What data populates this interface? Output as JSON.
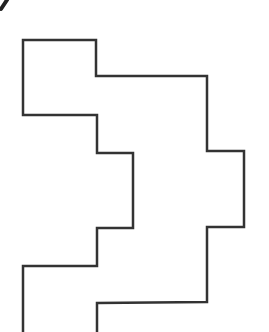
{
  "figure": {
    "width": 269,
    "height": 332,
    "background": "#ffffff",
    "stroke_color": "#333333",
    "stroke_width": 2.5,
    "corner_mark": {
      "points": [
        [
          7,
          0
        ],
        [
          1,
          9
        ]
      ],
      "color": "#222222",
      "width": 4
    },
    "outer_path": [
      [
        23,
        332
      ],
      [
        23,
        266
      ],
      [
        97,
        266
      ],
      [
        97,
        228
      ],
      [
        133,
        228
      ],
      [
        133,
        153
      ],
      [
        97,
        153
      ],
      [
        97,
        115
      ],
      [
        23,
        115
      ],
      [
        23,
        40
      ],
      [
        96,
        40
      ],
      [
        96,
        76
      ],
      [
        207,
        76
      ],
      [
        207,
        151
      ],
      [
        244,
        151
      ],
      [
        244,
        227
      ],
      [
        207,
        227
      ],
      [
        207,
        302
      ],
      [
        97,
        303
      ],
      [
        97,
        332
      ]
    ]
  }
}
